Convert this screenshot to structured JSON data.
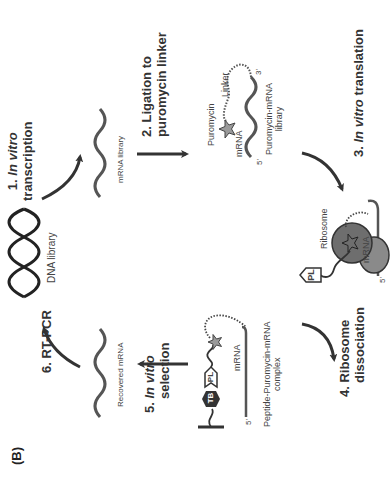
{
  "figure": {
    "panel_label": "(B)",
    "orientation": "rotated 90 degrees counterclockwise",
    "colors": {
      "strand": "#555555",
      "helix": "#222222",
      "arrow": "#333333",
      "ribosome_large": "#6e6e6e",
      "ribosome_small": "#8a8a8a",
      "star": "#9a9a9a",
      "tb_tag": "#333333"
    }
  },
  "steps": [
    {
      "id": 1,
      "number": "1.",
      "italic": "In vitro",
      "rest": "transcription"
    },
    {
      "id": 2,
      "number": "2.",
      "line1": "Ligation to",
      "line2": "puromycin linker"
    },
    {
      "id": 3,
      "number": "3.",
      "italic": "In vitro",
      "rest": "translation"
    },
    {
      "id": 4,
      "number": "4.",
      "line1": "Ribosome",
      "line2": "dissociation"
    },
    {
      "id": 5,
      "number": "5.",
      "italic": "In vitro",
      "rest": "selection"
    },
    {
      "id": 6,
      "number": "6.",
      "label": "RT-PCR"
    }
  ],
  "nodes": {
    "dna_library": {
      "label": "DNA library"
    },
    "mrna_library": {
      "label": "mRNA library"
    },
    "puromycin_mrna": {
      "puromycin": "Puromycin",
      "linker": "Linker",
      "mrna": "mRNA",
      "five_prime": "5'",
      "three_prime": "3'",
      "caption_line1": "Puromycin-mRNA",
      "caption_line2": "library"
    },
    "ribosome_complex": {
      "ribosome": "Ribosome",
      "pl": "PL",
      "mrna": "mRNA",
      "five_prime": "5'"
    },
    "peptide_complex": {
      "tb": "TB",
      "pl": "PL",
      "mrna": "mRNA",
      "five_prime": "5'",
      "caption_line1": "Peptide-Puromycin-mRNA",
      "caption_line2": "complex"
    },
    "recovered_mrna": {
      "label": "Recovered mRNA"
    }
  }
}
